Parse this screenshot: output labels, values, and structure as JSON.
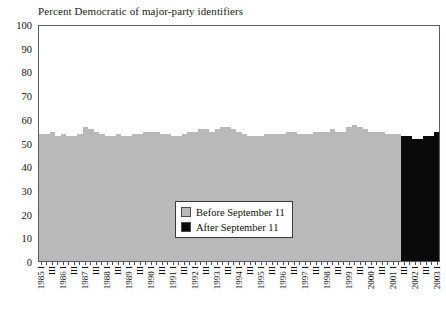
{
  "chart_data": {
    "type": "bar",
    "title": "Percent Democratic of major-party identifiers",
    "xlabel": "",
    "ylabel": "",
    "ylim": [
      0,
      100
    ],
    "yticks": [
      0,
      10,
      20,
      30,
      40,
      50,
      60,
      70,
      80,
      90,
      100
    ],
    "grid": false,
    "legend_position": "inside-lower-center",
    "legend": [
      {
        "label": "Before September 11",
        "color": "#b9b9b9"
      },
      {
        "label": "After September 11",
        "color": "#0a0a0a"
      }
    ],
    "categories": [
      "1985 I",
      "",
      "III",
      "",
      "1986 I",
      "",
      "III",
      "",
      "1987 I",
      "",
      "III",
      "",
      "1988 I",
      "",
      "III",
      "",
      "1989 I",
      "",
      "III",
      "",
      "1990 I",
      "",
      "III",
      "",
      "1991 I",
      "",
      "III",
      "",
      "1992 I",
      "",
      "III",
      "",
      "1993 I",
      "",
      "III",
      "",
      "1994 I",
      "",
      "III",
      "",
      "1995 I",
      "",
      "III",
      "",
      "1996 I",
      "",
      "III",
      "",
      "1997 I",
      "",
      "III",
      "",
      "1998 I",
      "",
      "III",
      "",
      "1999 I",
      "",
      "III",
      "",
      "2000 I",
      "",
      "III",
      "",
      "2001 I",
      "",
      "III",
      "",
      "2002 I",
      "",
      "III",
      "",
      "2003 I"
    ],
    "values": [
      54,
      54,
      55,
      53,
      54,
      53,
      53,
      54,
      57,
      56,
      55,
      54,
      53,
      53,
      54,
      53,
      53,
      54,
      54,
      55,
      55,
      55,
      54,
      54,
      53,
      53,
      54,
      55,
      55,
      56,
      56,
      55,
      56,
      57,
      57,
      56,
      55,
      54,
      53,
      53,
      53,
      54,
      54,
      54,
      54,
      55,
      55,
      54,
      54,
      54,
      55,
      55,
      55,
      56,
      55,
      55,
      57,
      58,
      57,
      56,
      55,
      55,
      55,
      54,
      54,
      54,
      53,
      53,
      52,
      52,
      53,
      53,
      55
    ],
    "series": [
      {
        "name": "Before September 11",
        "color": "#b9b9b9",
        "count": 66
      },
      {
        "name": "After September 11",
        "color": "#0a0a0a",
        "count": 7
      }
    ],
    "split_index": 66,
    "bar_colors_by_index_rule": "index < 66 -> Before September 11 (gray); index >= 66 -> After September 11 (black)"
  }
}
